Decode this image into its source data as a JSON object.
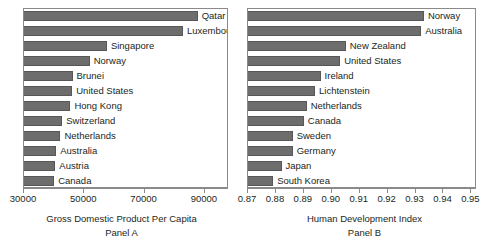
{
  "figure": {
    "background_color": "#ffffff",
    "bar_color": "#6d6d6d",
    "frame_color": "#8a8a8a",
    "text_color": "#231f20"
  },
  "panels": [
    {
      "id": "panel-a",
      "caption_title": "Gross Domestic Product Per Capita",
      "caption_sub": "Panel A"
    },
    {
      "id": "panel-b",
      "caption_title": "Human Development Index",
      "caption_sub": "Panel B"
    }
  ],
  "chart_data": [
    {
      "type": "bar",
      "orientation": "horizontal",
      "title": "Gross Domestic Product Per Capita",
      "subtitle": "Panel A",
      "xlabel": "",
      "ylabel": "",
      "xlim": [
        30000,
        98000
      ],
      "xticks": [
        30000,
        50000,
        70000,
        90000
      ],
      "xticklabels": [
        "30000",
        "50000",
        "70000",
        "90000"
      ],
      "grid": false,
      "legend": false,
      "categories": [
        "Qatar",
        "Luxembourg",
        "Singapore",
        "Norway",
        "Brunei",
        "United States",
        "Hong Kong",
        "Switzerland",
        "Netherlands",
        "Australia",
        "Austria",
        "Canada"
      ],
      "values": [
        87600,
        82700,
        57500,
        51800,
        46100,
        46000,
        45400,
        42700,
        42100,
        40700,
        40400,
        40000
      ]
    },
    {
      "type": "bar",
      "orientation": "horizontal",
      "title": "Human Development Index",
      "subtitle": "Panel B",
      "xlabel": "",
      "ylabel": "",
      "xlim": [
        0.87,
        0.952
      ],
      "xticks": [
        0.87,
        0.88,
        0.89,
        0.9,
        0.91,
        0.92,
        0.93,
        0.94,
        0.95
      ],
      "xticklabels": [
        "0.87",
        "0.88",
        "0.89",
        "0.90",
        "0.91",
        "0.92",
        "0.93",
        "0.94",
        "0.95"
      ],
      "grid": false,
      "legend": false,
      "categories": [
        "Norway",
        "Australia",
        "New Zealand",
        "United States",
        "Ireland",
        "Lichtenstein",
        "Netherlands",
        "Canada",
        "Sweden",
        "Germany",
        "Japan",
        "South Korea"
      ],
      "values": [
        0.933,
        0.932,
        0.905,
        0.903,
        0.896,
        0.894,
        0.891,
        0.89,
        0.886,
        0.886,
        0.882,
        0.879
      ]
    }
  ]
}
